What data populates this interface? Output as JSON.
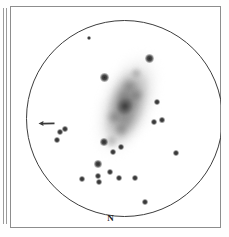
{
  "figure": {
    "kind": "astronomical-observing-sketch",
    "orientation_label": "N",
    "field_of_view_shape": "circle",
    "background_color": "#ffffff",
    "ink_color": "#2a2a2a",
    "frame_color": "#8d8d8d",
    "circle_color": "#3d3d3d"
  },
  "neighbor": {
    "description": "clipped edge of adjacent plate frame"
  },
  "object": {
    "type": "spiral-galaxy",
    "appearance": "elongated diffuse oval with brighter elongated core, tilted about 22 degrees from vertical",
    "position_angle_deg": 22,
    "center_x": 117,
    "center_y": 98,
    "major_axis_px": 120,
    "minor_axis_px": 66
  },
  "marker": {
    "type": "arrow",
    "direction": "left",
    "x": 28,
    "y": 114,
    "length_px": 17
  },
  "stars": [
    {
      "x": 142,
      "y": 55,
      "size": 7.0,
      "label": "bright star north-east of galaxy"
    },
    {
      "x": 97,
      "y": 74,
      "size": 6.4,
      "label": "bright star west of galaxy"
    },
    {
      "x": 96,
      "y": 138,
      "size": 5.6,
      "label": "star south-west of core"
    },
    {
      "x": 104,
      "y": 147,
      "size": 4.0,
      "label": "faint star below galaxy"
    },
    {
      "x": 112,
      "y": 142,
      "size": 4.6,
      "label": "star below galaxy"
    },
    {
      "x": 90,
      "y": 160,
      "size": 6.2,
      "label": "bright star south-west"
    },
    {
      "x": 72,
      "y": 173,
      "size": 4.2,
      "label": "faint star south-west outer"
    },
    {
      "x": 88,
      "y": 170,
      "size": 4.4,
      "label": "faint star south"
    },
    {
      "x": 90,
      "y": 177,
      "size": 4.0,
      "label": "faint star south lower"
    },
    {
      "x": 101,
      "y": 167,
      "size": 4.6,
      "label": "faint star south centre"
    },
    {
      "x": 110,
      "y": 173,
      "size": 4.0,
      "label": "faint star south centre-east"
    },
    {
      "x": 126,
      "y": 173,
      "size": 4.2,
      "label": "faint star south-east"
    },
    {
      "x": 148,
      "y": 97,
      "size": 4.8,
      "label": "star east of galaxy"
    },
    {
      "x": 145,
      "y": 117,
      "size": 4.4,
      "label": "star east lower"
    },
    {
      "x": 152,
      "y": 114,
      "size": 3.2,
      "label": "very faint star east"
    },
    {
      "x": 167,
      "y": 148,
      "size": 4.4,
      "label": "faint star east outer"
    },
    {
      "x": 136,
      "y": 197,
      "size": 4.4,
      "label": "faint star far south"
    },
    {
      "x": 53,
      "y": 127,
      "size": 4.6,
      "label": "star west pair upper"
    },
    {
      "x": 58,
      "y": 124,
      "size": 3.4,
      "label": "star west pair companion"
    },
    {
      "x": 50,
      "y": 135,
      "size": 4.0,
      "label": "star west pair lower"
    },
    {
      "x": 81,
      "y": 33,
      "size": 2.6,
      "label": "very faint star north-west"
    }
  ]
}
